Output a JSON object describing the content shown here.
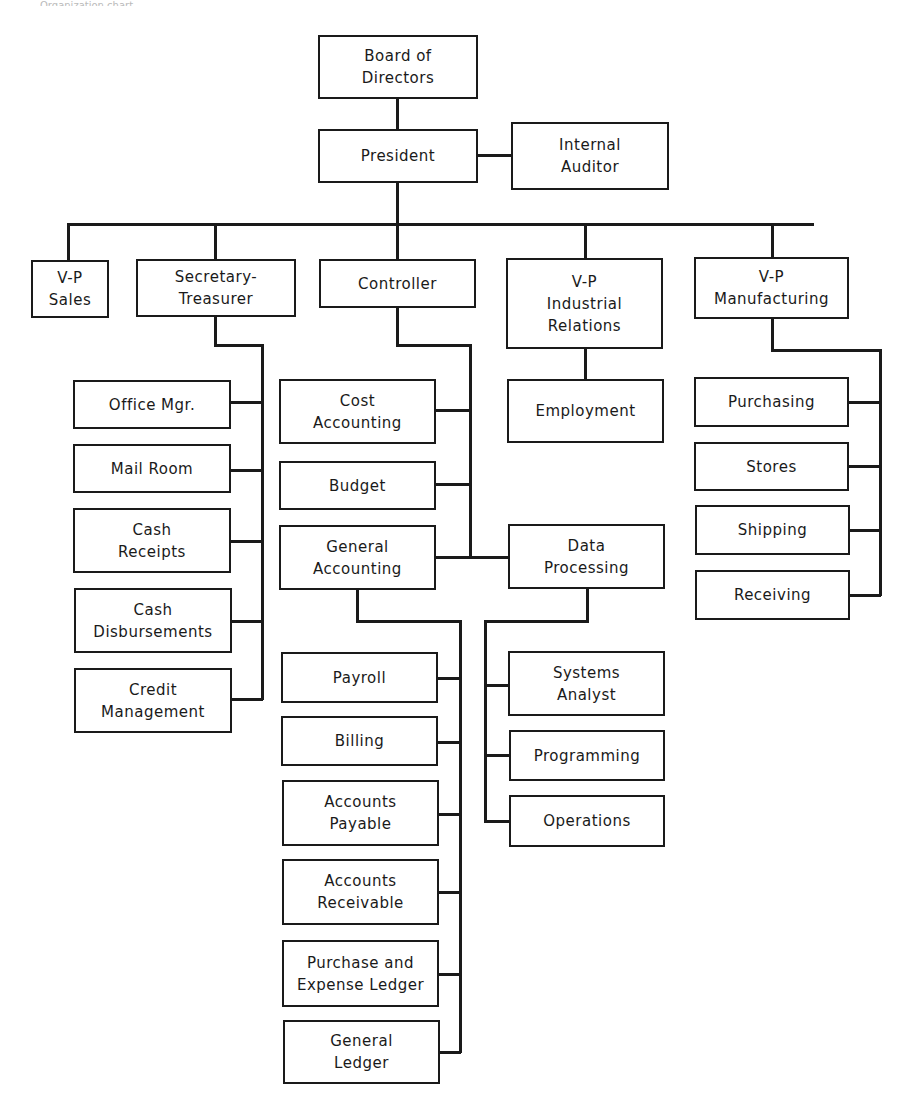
{
  "header": {
    "caption": "Organization chart"
  },
  "nodes": {
    "board": "Board of\nDirectors",
    "president": "President",
    "auditor": "Internal\nAuditor",
    "vp_sales": "V-P\nSales",
    "sec_treasurer": "Secretary-\nTreasurer",
    "controller": "Controller",
    "vp_ir": "V-P\nIndustrial\nRelations",
    "vp_mfg": "V-P\nManufacturing",
    "office_mgr": "Office Mgr.",
    "mail_room": "Mail Room",
    "cash_receipts": "Cash\nReceipts",
    "cash_disb": "Cash\nDisbursements",
    "credit_mgmt": "Credit\nManagement",
    "cost_acct": "Cost\nAccounting",
    "budget": "Budget",
    "gen_acct": "General\nAccounting",
    "data_proc": "Data\nProcessing",
    "employment": "Employment",
    "purchasing": "Purchasing",
    "stores": "Stores",
    "shipping": "Shipping",
    "receiving": "Receiving",
    "payroll": "Payroll",
    "billing": "Billing",
    "ap": "Accounts\nPayable",
    "ar": "Accounts\nReceivable",
    "purchase_ledger": "Purchase and\nExpense Ledger",
    "gen_ledger": "General\nLedger",
    "systems_analyst": "Systems\nAnalyst",
    "programming": "Programming",
    "operations": "Operations"
  }
}
